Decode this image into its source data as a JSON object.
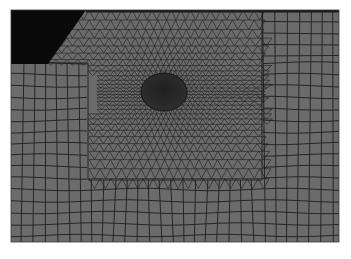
{
  "figure": {
    "type": "finite-element-mesh",
    "colors": {
      "background": "#ffffff",
      "mesh_fill": "#6b6b6b",
      "mesh_line": "#1e1e1e",
      "void_region": "#0a0a0a",
      "inclusion": "#262626"
    },
    "panel": {
      "x": 11,
      "y": 10,
      "width": 328,
      "height": 232
    },
    "void_corner": {
      "points": "11,10 86,10 48,64 11,64"
    },
    "triangle_zone": {
      "x_left": 88,
      "x_right": 262,
      "y_bottom": 180
    },
    "inclusion": {
      "cx": 164,
      "cy": 92,
      "rx": 23,
      "ry": 19
    }
  }
}
